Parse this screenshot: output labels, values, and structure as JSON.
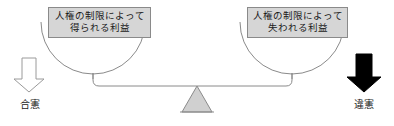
{
  "diagram": {
    "pans": {
      "left": {
        "box": {
          "line1": "人権の制限によって",
          "line2": "得られる利益"
        }
      },
      "right": {
        "box": {
          "line1": "人権の制限によって",
          "line2": "失われる利益"
        }
      }
    },
    "arrows": {
      "left": {
        "name": "down-arrow-outline-icon",
        "style": "outline",
        "direction": "down",
        "fill": "#ffffff",
        "stroke": "#9a9a9a"
      },
      "right": {
        "name": "down-arrow-solid-icon",
        "style": "solid",
        "direction": "down",
        "fill": "#000000",
        "stroke": "#000000"
      }
    },
    "labels": {
      "left": "合憲",
      "right": "違憲"
    },
    "colors": {
      "box_fill": "#d6d6d6",
      "box_border": "#8a8a8a",
      "fulcrum_fill": "#d0d0d0",
      "fulcrum_stroke": "#8a8a8a",
      "beam_stroke": "#8a8a8a",
      "pan_stroke": "#8a8a8a",
      "text": "#1a1a1a",
      "background": "#ffffff"
    }
  }
}
